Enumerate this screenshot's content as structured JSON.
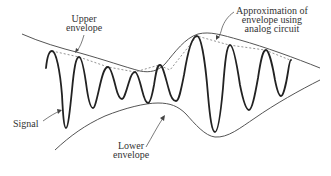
{
  "diagram": {
    "title": "",
    "labels": {
      "upper_envelope": [
        "Upper",
        "envelope"
      ],
      "approximation": [
        "Approximation of",
        "envelope using",
        "analog circuit"
      ],
      "signal": "Signal",
      "lower_envelope": [
        "Lower",
        "envelope"
      ]
    },
    "colors": {
      "signal": "#222222",
      "envelope": "#555555",
      "approximation": "#777777",
      "text": "#333333",
      "background": "#ffffff"
    }
  }
}
